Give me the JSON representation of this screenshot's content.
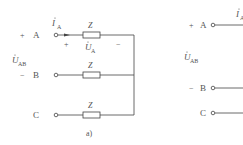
{
  "figure_a": {
    "caption": "a)",
    "terminals": [
      {
        "name": "A",
        "sign": "+"
      },
      {
        "name": "B",
        "sign": "−"
      },
      {
        "name": "C",
        "sign": ""
      }
    ],
    "impedances": [
      "Z",
      "Z",
      "Z"
    ],
    "current_label": {
      "main": "I",
      "sub": "A"
    },
    "voltage_ab": {
      "main": "U",
      "sub": "AB"
    },
    "voltage_a": {
      "main": "U",
      "sub": "A",
      "plus": "+",
      "minus": "−"
    }
  },
  "figure_b": {
    "terminals": [
      {
        "name": "A",
        "sign": "+"
      },
      {
        "name": "B",
        "sign": "−"
      },
      {
        "name": "C",
        "sign": ""
      }
    ],
    "current_label": {
      "main": "I",
      "sub": "A"
    },
    "voltage_ab": {
      "main": "U",
      "sub": "AB"
    }
  },
  "colors": {
    "line": "#444444",
    "text": "#555555"
  }
}
